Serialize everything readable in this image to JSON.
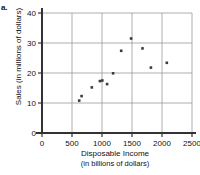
{
  "figure": {
    "part_label": "a."
  },
  "chart_data": {
    "type": "scatter",
    "title": "",
    "xlabel": "Disposable Income",
    "xlabel_sub": "(in billions of dollars)",
    "ylabel": "Sales (in millions of dollars)",
    "xlim": [
      0,
      2500
    ],
    "ylim": [
      0,
      40
    ],
    "xticks": [
      0,
      500,
      1000,
      1500,
      2000,
      2500
    ],
    "yticks": [
      0,
      10,
      20,
      30,
      40
    ],
    "xtick_labels": [
      "0",
      "500",
      "1000",
      "1500",
      "2000",
      "2500"
    ],
    "ytick_labels": [
      "0",
      "10",
      "20",
      "30",
      "40"
    ],
    "grid": true,
    "grid_color": "#9a9a9a",
    "legend": null,
    "marker_color": "#3b3b3b",
    "axis_color": "#333333",
    "points": [
      {
        "x": 620,
        "y": 10.8
      },
      {
        "x": 660,
        "y": 12.3
      },
      {
        "x": 830,
        "y": 15.2
      },
      {
        "x": 965,
        "y": 17.3
      },
      {
        "x": 1005,
        "y": 17.5
      },
      {
        "x": 1085,
        "y": 16.3
      },
      {
        "x": 1185,
        "y": 19.9
      },
      {
        "x": 1320,
        "y": 27.4
      },
      {
        "x": 1485,
        "y": 31.5
      },
      {
        "x": 1675,
        "y": 28.2
      },
      {
        "x": 1815,
        "y": 21.8
      },
      {
        "x": 2080,
        "y": 23.4
      }
    ]
  }
}
